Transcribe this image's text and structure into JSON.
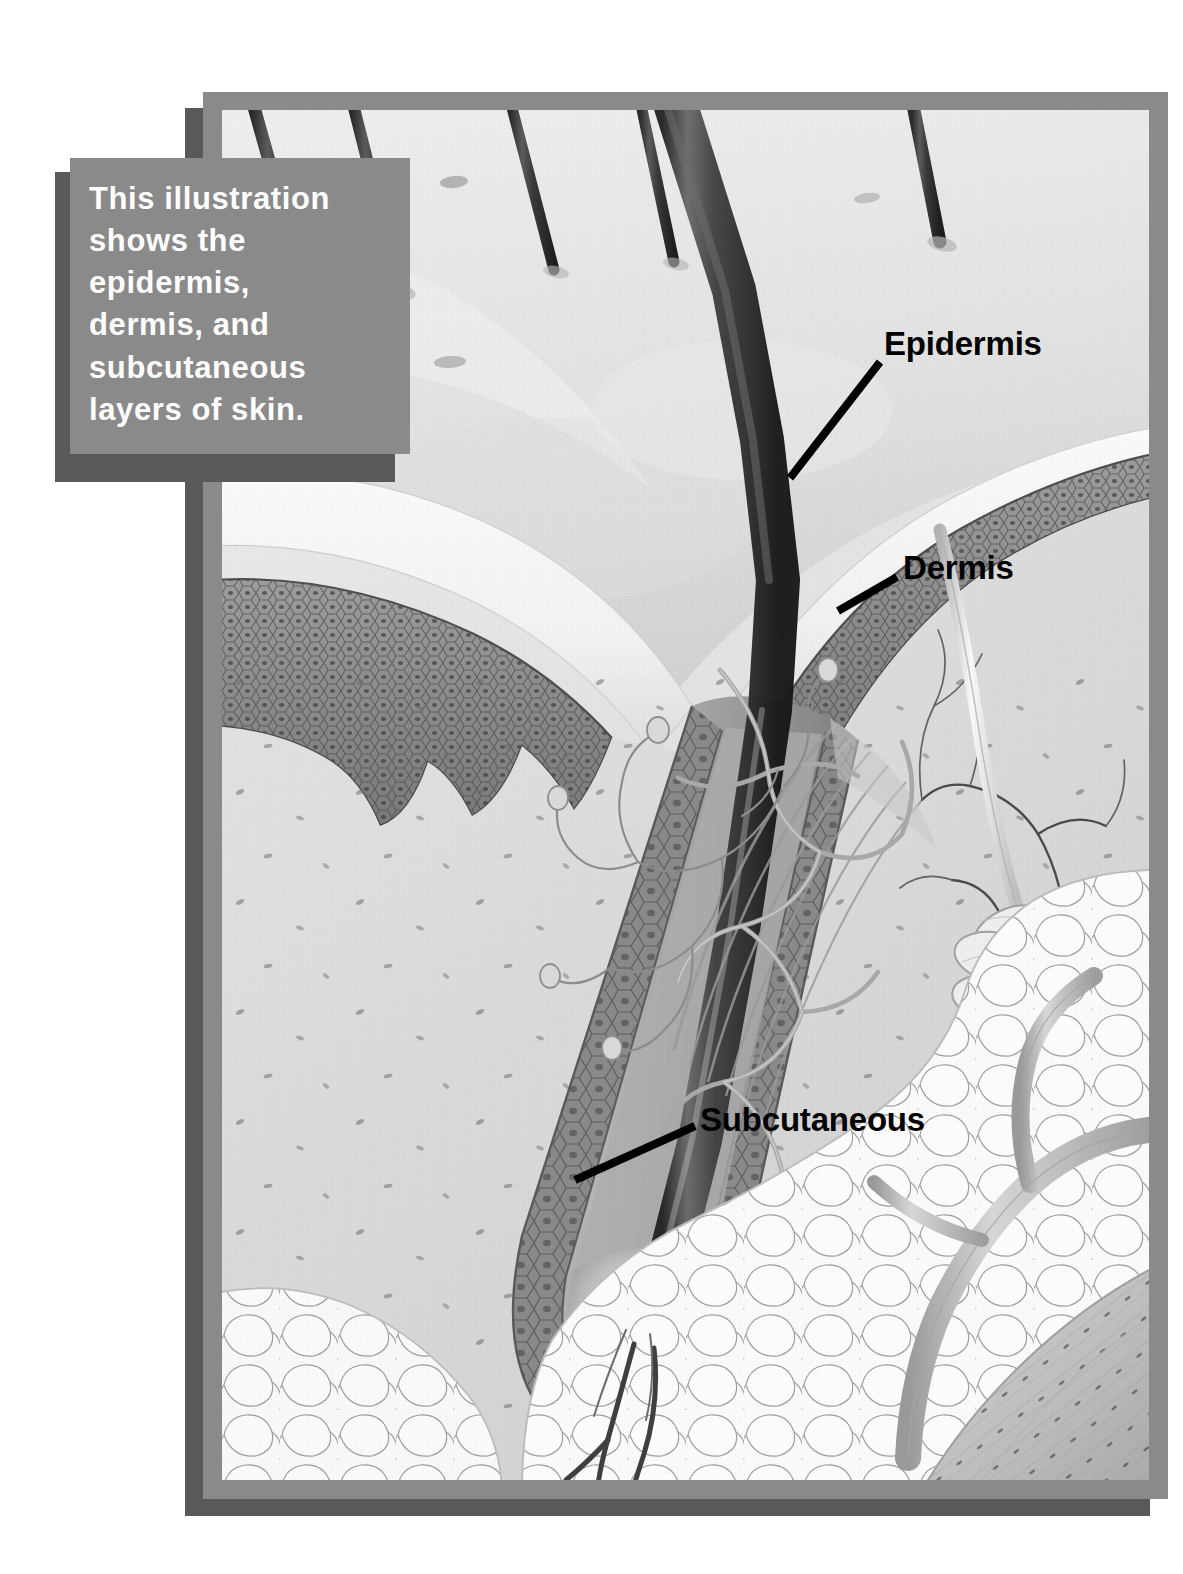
{
  "figure": {
    "kind": "anatomical-illustration",
    "caption": {
      "text": "This illustration\nshows the\nepidermis,\ndermis, and\nsubcutaneous\nlayers of skin.",
      "background_color": "#8a8a8a",
      "text_color": "#ffffff",
      "shadow_color": "#5a5a5a"
    },
    "frame": {
      "border_color": "#8a8a8a",
      "shadow_color": "#595959",
      "plate_background": "#e9e9e9"
    },
    "labels": [
      {
        "id": "epidermis",
        "text": "Epidermis",
        "leader_from": [
          880,
          362
        ],
        "leader_to": [
          790,
          478
        ],
        "color": "#000000"
      },
      {
        "id": "dermis",
        "text": "Dermis",
        "leader_from": [
          897,
          577
        ],
        "leader_to": [
          838,
          611
        ],
        "color": "#000000"
      },
      {
        "id": "subcutaneous",
        "text": "Subcutaneous",
        "leader_from": [
          695,
          1126
        ],
        "leader_to": [
          575,
          1180
        ],
        "color": "#000000"
      }
    ],
    "anatomy_parts": [
      "hair shafts emerging from skin surface",
      "stratum corneum",
      "epidermis cellular layer",
      "dermal papillae",
      "hair follicle with internal and external root sheath",
      "arrector pili muscle",
      "sebaceous region",
      "capillary / collagen fiber network in dermis",
      "nerve endings",
      "eccrine sweat gland coil",
      "sweat gland duct",
      "subcutaneous adipose (fat) cells",
      "blood vessels supplying hair bulb",
      "dermal papilla at hair bulb",
      "skeletal muscle fascicle"
    ]
  }
}
